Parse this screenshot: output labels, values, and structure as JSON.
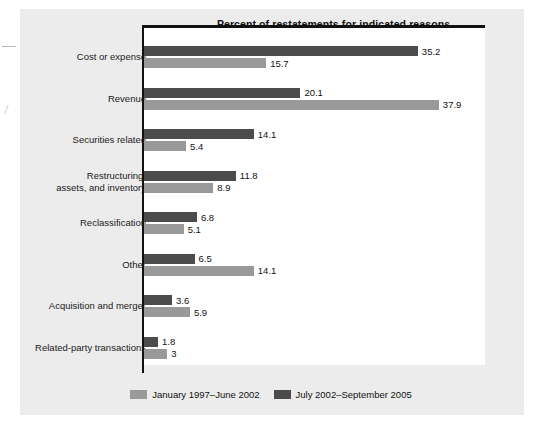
{
  "chart_data": {
    "type": "bar",
    "orientation": "horizontal",
    "title": "Percent of restatements for indicated reasons",
    "xlabel": "",
    "ylabel": "",
    "grid": false,
    "legend_position": "bottom",
    "xlim": [
      0,
      40
    ],
    "categories": [
      "Cost or expense",
      "Revenue",
      "Securities related",
      "Restructuring,\nassets, and inventory",
      "Reclassification",
      "Other",
      "Acquisition and merger",
      "Related-party transactions"
    ],
    "series": [
      {
        "name": "July 2002–September 2005",
        "color": "#4b4b4b",
        "values": [
          35.2,
          20.1,
          14.1,
          11.8,
          6.8,
          6.5,
          3.6,
          1.8
        ],
        "labels": [
          "35.2",
          "20.1",
          "14.1",
          "11.8",
          "6.8",
          "6.5",
          "3.6",
          "1.8"
        ]
      },
      {
        "name": "January 1997–June 2002",
        "color": "#9a9a9a",
        "values": [
          15.7,
          37.9,
          5.4,
          8.9,
          5.1,
          14.1,
          5.9,
          3.0
        ],
        "labels": [
          "15.7",
          "37.9",
          "5.4",
          "8.9",
          "5.1",
          "14.1",
          "5.9",
          "3"
        ]
      }
    ]
  },
  "chart": {
    "title": "Percent of restatements for indicated reasons",
    "rows": [
      {
        "label_line1": "Cost or expense",
        "label_line2": "",
        "recent_value": "35.2",
        "earlier_value": "15.7"
      },
      {
        "label_line1": "Revenue",
        "label_line2": "",
        "recent_value": "20.1",
        "earlier_value": "37.9"
      },
      {
        "label_line1": "Securities related",
        "label_line2": "",
        "recent_value": "14.1",
        "earlier_value": "5.4"
      },
      {
        "label_line1": "Restructuring,",
        "label_line2": "assets, and inventory",
        "recent_value": "11.8",
        "earlier_value": "8.9"
      },
      {
        "label_line1": "Reclassification",
        "label_line2": "",
        "recent_value": "6.8",
        "earlier_value": "5.1"
      },
      {
        "label_line1": "Other",
        "label_line2": "",
        "recent_value": "6.5",
        "earlier_value": "14.1"
      },
      {
        "label_line1": "Acquisition and merger",
        "label_line2": "",
        "recent_value": "3.6",
        "earlier_value": "5.9"
      },
      {
        "label_line1": "Related-party transactions",
        "label_line2": "",
        "recent_value": "1.8",
        "earlier_value": "3"
      }
    ],
    "legend": {
      "earlier_label": "January 1997–June 2002",
      "recent_label": "July 2002–September 2005",
      "earlier_color": "#9a9a9a",
      "recent_color": "#4b4b4b"
    }
  }
}
